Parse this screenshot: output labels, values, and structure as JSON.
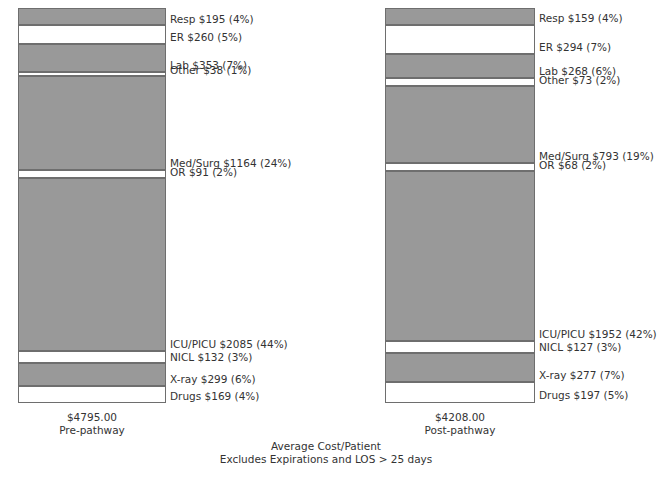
{
  "chart_data": {
    "type": "bar",
    "title": "Average Cost/Patient",
    "subtitle": "Excludes Expirations and LOS > 25 days",
    "xlabel": "",
    "ylabel": "",
    "stacked": true,
    "grid": false,
    "legend_position": "inline-right-of-bars",
    "categories": [
      "Resp",
      "ER",
      "Lab",
      "Other",
      "Med/Surg",
      "OR",
      "ICU/PICU",
      "NICL",
      "X-ray",
      "Drugs"
    ],
    "series": [
      {
        "name": "Pre-pathway",
        "total": 4795.0,
        "total_label": "$4795.00",
        "values": [
          195,
          260,
          353,
          38,
          1164,
          91,
          2085,
          132,
          299,
          169
        ],
        "percents": [
          4,
          5,
          7,
          1,
          24,
          2,
          44,
          3,
          6,
          4
        ]
      },
      {
        "name": "Post-pathway",
        "total": 4208.0,
        "total_label": "$4208.00",
        "values": [
          159,
          294,
          268,
          73,
          793,
          68,
          1952,
          127,
          277,
          197
        ],
        "percents": [
          4,
          7,
          6,
          2,
          19,
          2,
          42,
          3,
          7,
          5
        ]
      }
    ]
  },
  "colors": {
    "fill_gray": "#999999",
    "fill_white": "#ffffff",
    "stroke": "#6e6e6e",
    "text": "#333333"
  },
  "left_chart": {
    "total_amount": "$4795.00",
    "total_caption": "Pre-pathway",
    "segments": [
      {
        "label": "Resp $195 (4%)",
        "fill": "gray",
        "pct": 4
      },
      {
        "label": "ER $260 (5%)",
        "fill": "white",
        "pct": 5
      },
      {
        "label": "Lab $353 (7%)",
        "fill": "gray",
        "pct": 7
      },
      {
        "label": "Other $38 (1%)",
        "fill": "white",
        "pct": 1
      },
      {
        "label": "Med/Surg $1164 (24%)",
        "fill": "gray",
        "pct": 24
      },
      {
        "label": "OR $91 (2%)",
        "fill": "white",
        "pct": 2
      },
      {
        "label": "ICU/PICU $2085 (44%)",
        "fill": "gray",
        "pct": 44
      },
      {
        "label": "NICL $132 (3%)",
        "fill": "white",
        "pct": 3
      },
      {
        "label": "X-ray $299 (6%)",
        "fill": "gray",
        "pct": 6
      },
      {
        "label": "Drugs $169 (4%)",
        "fill": "white",
        "pct": 4
      }
    ]
  },
  "right_chart": {
    "total_amount": "$4208.00",
    "total_caption": "Post-pathway",
    "segments": [
      {
        "label": "Resp $159 (4%)",
        "fill": "gray",
        "pct": 4
      },
      {
        "label": "ER $294 (7%)",
        "fill": "white",
        "pct": 7
      },
      {
        "label": "Lab $268 (6%)",
        "fill": "gray",
        "pct": 6
      },
      {
        "label": "Other $73 (2%)",
        "fill": "white",
        "pct": 2
      },
      {
        "label": "Med/Surg $793 (19%)",
        "fill": "gray",
        "pct": 19
      },
      {
        "label": "OR $68 (2%)",
        "fill": "white",
        "pct": 2
      },
      {
        "label": "ICU/PICU $1952 (42%)",
        "fill": "gray",
        "pct": 42
      },
      {
        "label": "NICL $127 (3%)",
        "fill": "white",
        "pct": 3
      },
      {
        "label": "X-ray $277 (7%)",
        "fill": "gray",
        "pct": 7
      },
      {
        "label": "Drugs $197 (5%)",
        "fill": "white",
        "pct": 5
      }
    ]
  },
  "caption": {
    "line1": "Average Cost/Patient",
    "line2": "Excludes Expirations and LOS > 25 days"
  }
}
